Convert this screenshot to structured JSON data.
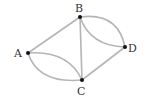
{
  "diagram": {
    "type": "multigraph",
    "colors": {
      "edge": "#b5b5b5",
      "node": "#111111",
      "label": "#333333"
    },
    "nodes": [
      {
        "id": "A",
        "label": "A",
        "x": 28,
        "y": 53
      },
      {
        "id": "B",
        "label": "B",
        "x": 80,
        "y": 17
      },
      {
        "id": "C",
        "label": "C",
        "x": 82,
        "y": 80
      },
      {
        "id": "D",
        "label": "D",
        "x": 125,
        "y": 47
      }
    ],
    "edges": [
      {
        "from": "A",
        "to": "B",
        "shape": "straight"
      },
      {
        "from": "B",
        "to": "C",
        "shape": "straight"
      },
      {
        "from": "C",
        "to": "D",
        "shape": "straight"
      },
      {
        "from": "A",
        "to": "C",
        "shape": "arc-upper"
      },
      {
        "from": "A",
        "to": "C",
        "shape": "arc-lower"
      },
      {
        "from": "B",
        "to": "D",
        "shape": "arc-upper"
      },
      {
        "from": "B",
        "to": "D",
        "shape": "arc-lower"
      }
    ]
  }
}
